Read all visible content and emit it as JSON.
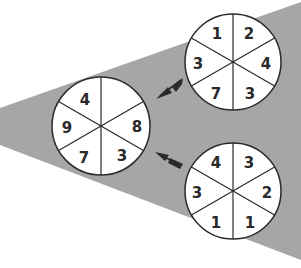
{
  "diagram": {
    "background": "#ffffff",
    "wedge_color": "#a6a6a6",
    "circle_fill": "#ffffff",
    "line_color": "#2a2a2a",
    "wheels": [
      {
        "id": "target-wheel",
        "segments": [
          "4",
          "",
          "8",
          "3",
          "7",
          "9"
        ]
      },
      {
        "id": "top-source-wheel",
        "segments": [
          "1",
          "2",
          "4",
          "3",
          "7",
          "3"
        ]
      },
      {
        "id": "bottom-source-wheel",
        "segments": [
          "4",
          "3",
          "2",
          "1",
          "1",
          "3"
        ]
      }
    ],
    "arrows": [
      {
        "from": "top-source-wheel",
        "to": "target-wheel"
      },
      {
        "from": "bottom-source-wheel",
        "to": "target-wheel"
      }
    ]
  }
}
